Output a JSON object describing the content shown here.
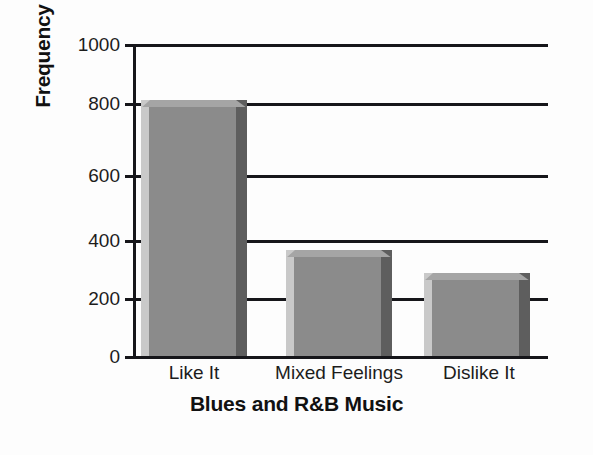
{
  "chart_data": {
    "type": "bar",
    "title": "",
    "xlabel": "Blues and R&B Music",
    "ylabel": "Frequency",
    "categories": [
      "Like It",
      "Mixed Feelings",
      "Dislike It"
    ],
    "values": [
      820,
      340,
      265
    ],
    "ylim": [
      0,
      1000
    ],
    "ytick_labels": [
      "1000",
      "800",
      "600",
      "400",
      "200",
      "0"
    ],
    "ytick_values": [
      1000,
      800,
      600,
      400,
      200,
      0
    ],
    "grid": true,
    "grid_axis": "y",
    "legend": null,
    "legend_position": "none",
    "series": [
      {
        "name": "Frequency",
        "values": [
          820,
          340,
          265
        ]
      }
    ],
    "colors": {
      "bar_face": "#8b8b8b",
      "bar_highlight": "#c9c9c9",
      "bar_shadow": "#5e5e5e",
      "bar_top": "#a5a5a5",
      "axis": "#16161a",
      "background": "#fdfdfd",
      "text": "#1c1c1c"
    }
  },
  "axis": {
    "y_title": "Frequency",
    "x_title": "Blues and R&B Music",
    "ticks": [
      {
        "label": "1000",
        "value": 1000
      },
      {
        "label": "800",
        "value": 800
      },
      {
        "label": "600",
        "value": 600
      },
      {
        "label": "400",
        "value": 400
      },
      {
        "label": "200",
        "value": 200
      },
      {
        "label": "0",
        "value": 0
      }
    ]
  },
  "bars": [
    {
      "label": "Like It",
      "value": 820
    },
    {
      "label": "Mixed Feelings",
      "value": 340
    },
    {
      "label": "Dislike It",
      "value": 265
    }
  ]
}
